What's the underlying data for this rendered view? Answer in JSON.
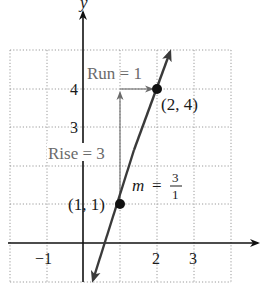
{
  "diagram": {
    "axes": {
      "x_label": "",
      "y_label": "y"
    },
    "x_ticks": [
      {
        "value": -1,
        "label": "−1"
      },
      {
        "value": 2,
        "label": "2"
      },
      {
        "value": 3,
        "label": "3"
      }
    ],
    "y_ticks": [
      {
        "value": 3,
        "label": "3"
      },
      {
        "value": 4,
        "label": "4"
      }
    ],
    "points": [
      {
        "x": 1,
        "y": 1,
        "label": "(1, 1)"
      },
      {
        "x": 2,
        "y": 4,
        "label": "(2, 4)"
      }
    ],
    "run_label": "Run = 1",
    "rise_label": "Rise = 3",
    "slope": {
      "m": "m",
      "eq": "=",
      "num": "3",
      "den": "1"
    },
    "grid": {
      "x_range": [
        -2,
        4
      ],
      "y_range": [
        -1,
        5
      ],
      "style": "dotted"
    },
    "colors": {
      "line": "#3a3a3a",
      "axis": "#111111",
      "grid": "#9a9a9a",
      "annotation": "#6a6a6a"
    }
  }
}
